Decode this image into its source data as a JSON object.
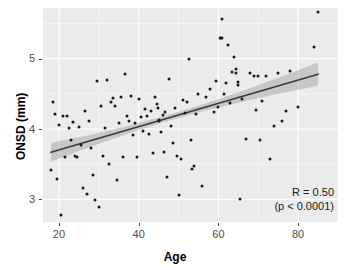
{
  "chart_data": {
    "type": "scatter",
    "title": "",
    "xlabel": "Age",
    "ylabel": "ONSD (mm)",
    "xlim": [
      16,
      90
    ],
    "ylim": [
      2.68,
      5.72
    ],
    "xticks": [
      20,
      40,
      60,
      80
    ],
    "yticks": [
      3,
      4,
      5
    ],
    "xticklabels": [
      "20",
      "40",
      "60",
      "80"
    ],
    "yticklabels": [
      "3",
      "4",
      "5"
    ],
    "grid": true,
    "legend": null,
    "annotations": [
      {
        "name": "correlation",
        "text": "R = 0.50"
      },
      {
        "name": "p-value",
        "text": "(p < 0.0001)"
      }
    ],
    "regression": {
      "name": "linear-fit",
      "x_start": 18,
      "x_end": 85,
      "y_start": 3.67,
      "y_end": 4.78,
      "slope": 0.01657,
      "intercept": 3.372,
      "line_color": "#3b3b3b",
      "band_color": "#9c9c9c",
      "band_opacity": 0.45,
      "band_half_width": [
        0.135,
        0.085,
        0.055,
        0.042,
        0.048,
        0.075,
        0.115,
        0.165
      ]
    },
    "style": {
      "panel_background": "#ebebeb",
      "grid_color": "#ffffff",
      "point_color": "#1a1a1a",
      "text_color": "#4d4d4d"
    },
    "points": [
      [
        18,
        3.42
      ],
      [
        18.5,
        4.38
      ],
      [
        19,
        4.22
      ],
      [
        19.5,
        3.29
      ],
      [
        20,
        4.06
      ],
      [
        20.5,
        2.78
      ],
      [
        21,
        4.18
      ],
      [
        21.5,
        3.61
      ],
      [
        22,
        4.18
      ],
      [
        22.5,
        4.02
      ],
      [
        23,
        3.85
      ],
      [
        23.5,
        4.1
      ],
      [
        24,
        3.62
      ],
      [
        24.5,
        3.6
      ],
      [
        25,
        4.03
      ],
      [
        25.5,
        3.78
      ],
      [
        26,
        3.17
      ],
      [
        26.5,
        4.25
      ],
      [
        27,
        3.08
      ],
      [
        27.5,
        4.12
      ],
      [
        28,
        3.73
      ],
      [
        28.5,
        3.35
      ],
      [
        29,
        2.99
      ],
      [
        29.5,
        4.69
      ],
      [
        30,
        2.9
      ],
      [
        30.5,
        4.33
      ],
      [
        31,
        3.62
      ],
      [
        31.5,
        4.01
      ],
      [
        32,
        4.7
      ],
      [
        32.5,
        3.5
      ],
      [
        33,
        4.38
      ],
      [
        33.5,
        4.44
      ],
      [
        34,
        4.33
      ],
      [
        34.5,
        3.27
      ],
      [
        35,
        4.09
      ],
      [
        35.5,
        4.46
      ],
      [
        36,
        3.6
      ],
      [
        36.5,
        4.78
      ],
      [
        37,
        4.19
      ],
      [
        37.5,
        4.11
      ],
      [
        38,
        4.47
      ],
      [
        38.5,
        3.91
      ],
      [
        39,
        4.08
      ],
      [
        39.5,
        3.6
      ],
      [
        40,
        4.43
      ],
      [
        40.5,
        4.17
      ],
      [
        41,
        3.97
      ],
      [
        41.5,
        4.28
      ],
      [
        42,
        4.18
      ],
      [
        42.5,
        3.93
      ],
      [
        43,
        4.26
      ],
      [
        43.5,
        3.66
      ],
      [
        44,
        4.46
      ],
      [
        44.5,
        4.35
      ],
      [
        44.8,
        4.3
      ],
      [
        45,
        4.11
      ],
      [
        45.2,
        4.13
      ],
      [
        45.5,
        3.96
      ],
      [
        46,
        4.2
      ],
      [
        46.3,
        3.67
      ],
      [
        46.5,
        4.24
      ],
      [
        47,
        3.32
      ],
      [
        47.5,
        4.71
      ],
      [
        48,
        4.04
      ],
      [
        48.5,
        3.8
      ],
      [
        49,
        4.3
      ],
      [
        49.5,
        3.62
      ],
      [
        50,
        3.07
      ],
      [
        50.5,
        3.57
      ],
      [
        51,
        4.41
      ],
      [
        51.5,
        4.23
      ],
      [
        52,
        4.38
      ],
      [
        52.5,
        4.99
      ],
      [
        53,
        3.85
      ],
      [
        53.5,
        3.43
      ],
      [
        54,
        3.47
      ],
      [
        54.5,
        4.22
      ],
      [
        55,
        4.5
      ],
      [
        56,
        3.19
      ],
      [
        57,
        4.46
      ],
      [
        58,
        4.57
      ],
      [
        59,
        4.24
      ],
      [
        59.5,
        4.69
      ],
      [
        60,
        4.32
      ],
      [
        60.3,
        5.3
      ],
      [
        60.6,
        5.3
      ],
      [
        60.9,
        5.3
      ],
      [
        61,
        5.56
      ],
      [
        61.5,
        4.5
      ],
      [
        62,
        4.66
      ],
      [
        62.5,
        5.19
      ],
      [
        63,
        4.37
      ],
      [
        63.5,
        4.81
      ],
      [
        64,
        5.03
      ],
      [
        64.3,
        4.86
      ],
      [
        64.5,
        4.8
      ],
      [
        64.8,
        4.62
      ],
      [
        65,
        4.67
      ],
      [
        65.5,
        3.0
      ],
      [
        66,
        4.43
      ],
      [
        67,
        3.86
      ],
      [
        68,
        4.8
      ],
      [
        69,
        4.76
      ],
      [
        69.5,
        4.27
      ],
      [
        70,
        4.76
      ],
      [
        70.5,
        3.85
      ],
      [
        71,
        4.4
      ],
      [
        72,
        4.76
      ],
      [
        73,
        3.58
      ],
      [
        74,
        4.05
      ],
      [
        75,
        4.79
      ],
      [
        76,
        4.11
      ],
      [
        77,
        4.25
      ],
      [
        78,
        4.82
      ],
      [
        80,
        4.31
      ],
      [
        84,
        5.17
      ],
      [
        85,
        5.66
      ]
    ]
  }
}
